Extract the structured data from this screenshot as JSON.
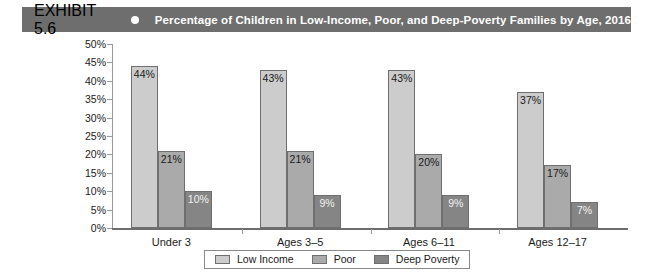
{
  "exhibit": {
    "number": "EXHIBIT 5.6",
    "bullet_icon": "circle-bullet-icon",
    "title": "Percentage of Children in Low-Income, Poor, and Deep-Poverty Families by Age, 2016",
    "header_background": "#6e6e6e",
    "header_text_color": "#ffffff"
  },
  "legend": {
    "position": "bottom-center",
    "items": [
      {
        "label": "Low Income",
        "color": "#cccccc"
      },
      {
        "label": "Poor",
        "color": "#aaaaaa"
      },
      {
        "label": "Deep Poverty",
        "color": "#858585"
      }
    ]
  },
  "chart_data": {
    "type": "bar",
    "title": "Percentage of Children in Low-Income, Poor, and Deep-Poverty Families by Age, 2016",
    "xlabel": "",
    "ylabel": "",
    "categories": [
      "Under 3",
      "Ages 3–5",
      "Ages 6–11",
      "Ages 12–17"
    ],
    "series": [
      {
        "name": "Low Income",
        "color": "#cccccc",
        "values": [
          44,
          43,
          43,
          37
        ],
        "labels": [
          "44%",
          "43%",
          "43%",
          "37%"
        ]
      },
      {
        "name": "Poor",
        "color": "#aaaaaa",
        "values": [
          21,
          21,
          20,
          17
        ],
        "labels": [
          "21%",
          "21%",
          "20%",
          "17%"
        ]
      },
      {
        "name": "Deep Poverty",
        "color": "#858585",
        "values": [
          10,
          9,
          9,
          7
        ],
        "labels": [
          "10%",
          "9%",
          "9%",
          "7%"
        ]
      }
    ],
    "ylim": [
      0,
      50
    ],
    "y_tick_values": [
      0,
      5,
      10,
      15,
      20,
      25,
      30,
      35,
      40,
      45,
      50
    ],
    "y_tick_labels": [
      "0%",
      "5%",
      "10%",
      "15%",
      "20%",
      "25%",
      "30%",
      "35%",
      "40%",
      "45%",
      "50%"
    ],
    "grid": false,
    "value_labels_inside_bars": true,
    "legend_position": "bottom-center"
  }
}
